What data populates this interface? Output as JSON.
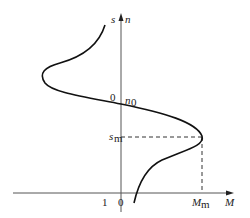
{
  "diagram": {
    "axes": {
      "vertical_left_label": "s",
      "vertical_right_label": "n",
      "horizontal_label": "M",
      "origin_label_vertical": "0",
      "n0_label": "n",
      "n0_sub": "0",
      "slip_one_label": "1",
      "origin_label_horizontal": "0"
    },
    "critical_point": {
      "sm_label": "s",
      "sm_sub": "m",
      "Mm_label": "M",
      "Mm_sub": "m"
    },
    "colors": {
      "line": "#1a1a1a",
      "axis": "#444444",
      "background": "#ffffff"
    }
  }
}
